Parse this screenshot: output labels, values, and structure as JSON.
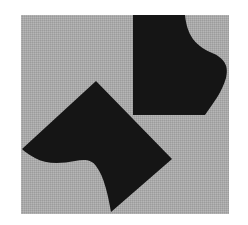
{
  "figure": {
    "background_color": "#ffffff",
    "panel": {
      "x": 21,
      "y": 15,
      "width": 208,
      "height": 199,
      "color": "#a9a9a9"
    },
    "shapes": [
      {
        "name": "upper-right-shape",
        "color": "#151515",
        "path": "M133,15 L185,15 C187,35 195,45 210,52 C225,58 229,66 226,78 C222,92 214,102 205,115 L133,115 Z"
      },
      {
        "name": "lower-left-shape",
        "color": "#151515",
        "path": "M96,81 L172,159 L111,212 C108,195 104,176 96,166 C92,160 85,159 75,161 C60,164 45,164 35,158 C28,154 24,151 22,149 Z"
      }
    ]
  }
}
